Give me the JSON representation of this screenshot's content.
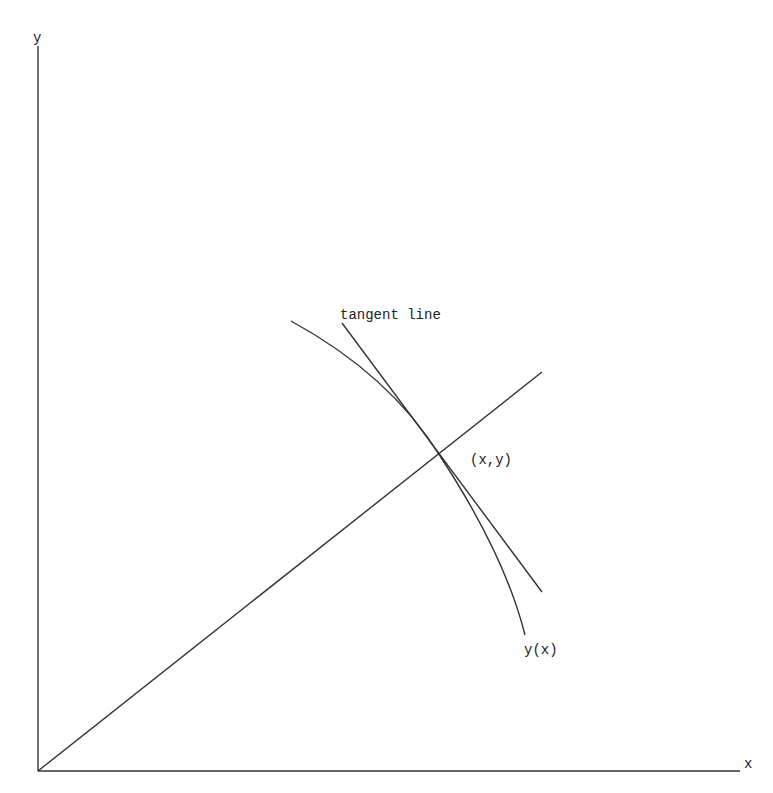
{
  "diagram": {
    "axes": {
      "x_label": "x",
      "y_label": "y",
      "origin": [
        38,
        771
      ],
      "x_end": [
        740,
        771
      ],
      "y_end": [
        38,
        46
      ]
    },
    "labels": {
      "tangent": "tangent line",
      "point": "(x,y)",
      "curve": "y(x)"
    },
    "elements": {
      "ray_from_origin": {
        "from": [
          38,
          771
        ],
        "to": [
          542,
          372
        ]
      },
      "curve_y_of_x": {
        "start": [
          291,
          321
        ],
        "through": [
          440,
          456
        ],
        "end": [
          525,
          635
        ]
      },
      "tangent_line": {
        "from": [
          342,
          323
        ],
        "to": [
          542,
          592
        ]
      },
      "tangent_point": [
        440,
        456
      ]
    },
    "colors": {
      "line": "#333333",
      "text": "#222222",
      "background": "#ffffff"
    }
  }
}
